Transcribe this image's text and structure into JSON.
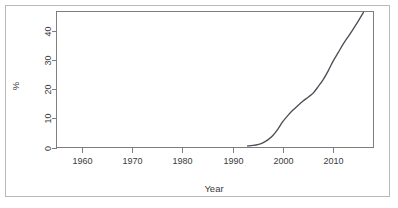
{
  "figure": {
    "background_color": "#ffffff",
    "frame_color": "#b9b9b9",
    "axis_color": "#7d7d7d"
  },
  "chart_data": {
    "type": "line",
    "title": "",
    "subtitle": "",
    "xlabel": "Year",
    "ylabel": "%",
    "xlim": [
      1955,
      2018
    ],
    "ylim": [
      0,
      46.5
    ],
    "grid": false,
    "legend": null,
    "line_color": "#4d4d57",
    "x_ticks": [
      1960,
      1970,
      1980,
      1990,
      2000,
      2010
    ],
    "x_tick_labels": [
      "1960",
      "1970",
      "1980",
      "1990",
      "2000",
      "2010"
    ],
    "y_ticks": [
      0,
      10,
      20,
      30,
      40
    ],
    "y_tick_labels": [
      "0",
      "10",
      "20",
      "30",
      "40"
    ],
    "series": [
      {
        "name": "percent",
        "x": [
          1993,
          1994,
          1995,
          1996,
          1997,
          1998,
          1999,
          2000,
          2001,
          2002,
          2003,
          2004,
          2005,
          2006,
          2007,
          2008,
          2009,
          2010,
          2011,
          2012,
          2013,
          2014,
          2015,
          2016
        ],
        "values": [
          0.5,
          0.7,
          1.0,
          1.6,
          2.6,
          4.1,
          6.3,
          8.9,
          11.0,
          12.8,
          14.4,
          15.9,
          17.2,
          18.6,
          20.8,
          23.2,
          26.2,
          29.6,
          32.5,
          35.4,
          38.0,
          40.6,
          43.3,
          46.2
        ]
      }
    ]
  },
  "labels": {
    "x_axis_title": "Year",
    "y_axis_title": "%"
  }
}
